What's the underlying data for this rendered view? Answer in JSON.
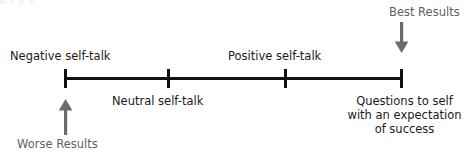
{
  "diagram": {
    "type": "continuum-scale",
    "title_artifact": "p     j   g  y",
    "axis": {
      "orientation": "horizontal",
      "color": "#111111",
      "start_x": 65,
      "end_x": 402,
      "tick_count": 4,
      "tick_positions_px": [
        65,
        168,
        285,
        401
      ]
    },
    "stage_labels": [
      {
        "id": "negative",
        "text": "Negative self-talk",
        "position": "above-left"
      },
      {
        "id": "positive",
        "text": "Positive self-talk",
        "position": "above-right"
      },
      {
        "id": "neutral",
        "text": "Neutral self-talk",
        "position": "below-center-left"
      }
    ],
    "questions_label": {
      "lines": [
        "Questions to self",
        "with an expectation",
        "of success"
      ],
      "position": "below-right"
    },
    "outcomes": [
      {
        "id": "best",
        "text": "Best Results",
        "color": "#5f5f5f",
        "arrow_direction": "down",
        "points_to": "right end of axis"
      },
      {
        "id": "worse",
        "text": "Worse Results",
        "color": "#5f5f5f",
        "arrow_direction": "up",
        "points_to": "left end of axis"
      }
    ],
    "colors": {
      "axis": "#111111",
      "stage_text": "#1b1b1b",
      "outcome_text": "#5f5f5f",
      "arrow": "#6b6b6b",
      "background": "#ffffff"
    }
  }
}
